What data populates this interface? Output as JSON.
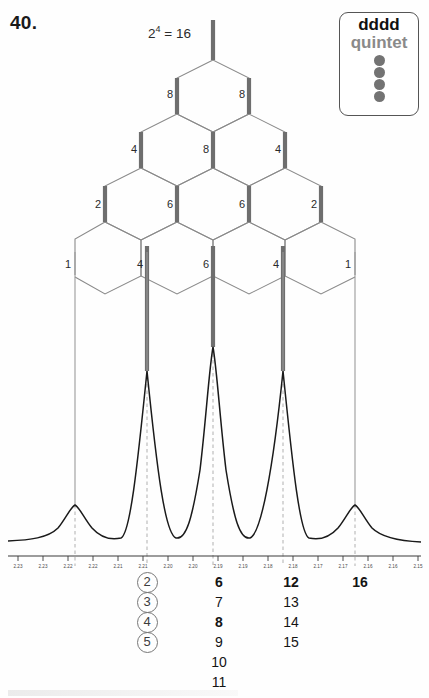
{
  "problem": {
    "number": "40."
  },
  "annotation": {
    "base": "2",
    "exponent": "4",
    "equals": " = 16",
    "full": "2^4 = 16"
  },
  "legend": {
    "title": "dddd",
    "subtitle": "quintet",
    "dot_count": 4,
    "dot_color": "#737373",
    "subtitle_color": "#8a8a8a"
  },
  "tree": {
    "rows": [
      {
        "row": 1,
        "labels": [
          "16"
        ]
      },
      {
        "row": 2,
        "labels": [
          "8",
          "8"
        ]
      },
      {
        "row": 3,
        "labels": [
          "4",
          "8",
          "4"
        ]
      },
      {
        "row": 4,
        "labels": [
          "2",
          "6",
          "6",
          "2"
        ]
      },
      {
        "row": 5,
        "labels": [
          "1",
          "4",
          "6",
          "4",
          "1"
        ]
      }
    ],
    "accent_color": "#6e6e6e",
    "line_color": "#8a8a8a"
  },
  "chart_data": {
    "type": "line",
    "title": "",
    "xlabel": "",
    "ylabel": "",
    "xlim": [
      2.235,
      2.147
    ],
    "x_axis_direction": "decreasing",
    "peaks": [
      {
        "ppm": 2.2215,
        "relative_intensity": 1,
        "label": "1"
      },
      {
        "ppm": 2.2045,
        "relative_intensity": 4,
        "label": "4"
      },
      {
        "ppm": 2.189,
        "relative_intensity": 6,
        "label": "6"
      },
      {
        "ppm": 2.1725,
        "relative_intensity": 4,
        "label": "4"
      },
      {
        "ppm": 2.1565,
        "relative_intensity": 1,
        "label": "1"
      }
    ],
    "intensity_ratio": "1:4:6:4:1",
    "tick_labels": [
      "2.23",
      "2.23",
      "2.22",
      "2.22",
      "2.21",
      "2.21",
      "2.20",
      "2.20",
      "2.19",
      "2.19",
      "2.18",
      "2.18",
      "2.17",
      "2.17",
      "2.16",
      "2.16",
      "2.15"
    ],
    "grid": false,
    "legend_position": "top-right"
  },
  "line_counts": {
    "columns": [
      {
        "id": "col-a",
        "circled": true,
        "values": [
          "2",
          "3",
          "4",
          "5"
        ],
        "bold": [
          false,
          false,
          false,
          false
        ]
      },
      {
        "id": "col-b",
        "circled": false,
        "values": [
          "6",
          "7",
          "8",
          "9",
          "10",
          "11"
        ],
        "bold": [
          true,
          false,
          true,
          false,
          false,
          false
        ]
      },
      {
        "id": "col-c",
        "circled": false,
        "values": [
          "12",
          "13",
          "14",
          "15"
        ],
        "bold": [
          true,
          false,
          false,
          false
        ]
      },
      {
        "id": "col-d",
        "circled": false,
        "values": [
          "16"
        ],
        "bold": [
          true
        ]
      }
    ]
  }
}
